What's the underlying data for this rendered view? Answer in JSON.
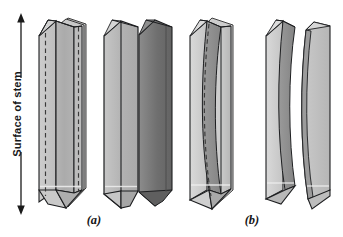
{
  "figure": {
    "axis": {
      "label": "Surface of stem",
      "arrow_name": "double-headed-vertical-arrow",
      "arrow_top_y": 14,
      "arrow_bottom_y": 214
    },
    "panels": [
      {
        "id": "a",
        "caption": "(a)"
      },
      {
        "id": "b",
        "caption": "(b)"
      }
    ],
    "colors": {
      "outline": "#1d1e20",
      "face_front_light": "#b9b9b9",
      "face_front_mid": "#a8a8a8",
      "face_side_light": "#cfcfcf",
      "face_side_pale": "#dcdcdc",
      "face_dark": "#7b7b7b",
      "face_darker": "#6a6a6a",
      "dashed_line": "#3a3a3a",
      "highlight": "#efefef",
      "background": "#ffffff"
    },
    "objects": [
      {
        "name": "crystal-single-hexagonal-prism",
        "panel": "a",
        "description": "single elongated hexagonal prism, dashed internal lines",
        "has_dashed_lines": true
      },
      {
        "name": "crystal-pair-overlapping-prisms",
        "panel": "a",
        "description": "two overlapping hexagonal prisms, rear one darker",
        "has_dashed_lines": false
      },
      {
        "name": "crystal-curved-single-prism",
        "panel": "b",
        "description": "single prism with curved internal dashed boundary",
        "has_dashed_lines": true
      },
      {
        "name": "crystal-split-curved-halves",
        "panel": "b",
        "description": "two separated curved half prisms",
        "has_dashed_lines": false
      }
    ]
  }
}
